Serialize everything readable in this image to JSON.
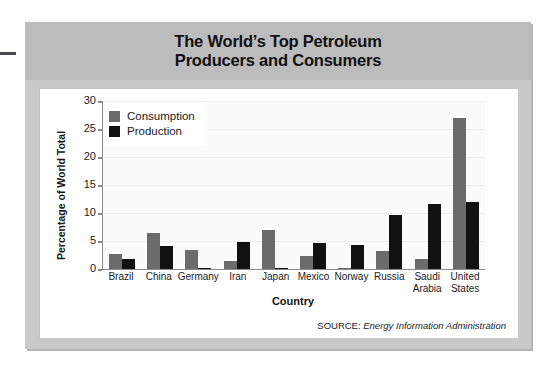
{
  "figure": {
    "title_line1": "The World’s Top Petroleum",
    "title_line2": "Producers and Consumers",
    "source_prefix": "SOURCE:",
    "source_name": "Energy Information Administration"
  },
  "colors": {
    "consumption": "#6b6b6b",
    "production": "#111111",
    "title_band": "#bcbcbc",
    "card": "#c9c9c9",
    "panel": "#ffffff"
  },
  "chart_data": {
    "type": "bar",
    "title": "The World’s Top Petroleum Producers and Consumers",
    "xlabel": "Country",
    "ylabel": "Percentage of World Total",
    "ylim": [
      0,
      30
    ],
    "yticks": [
      0,
      5,
      10,
      15,
      20,
      25,
      30
    ],
    "grid": true,
    "legend_position": "top-left",
    "categories": [
      "Brazil",
      "China",
      "Germany",
      "Iran",
      "Japan",
      "Mexico",
      "Norway",
      "Russia",
      "Saudi Arabia",
      "United States"
    ],
    "category_lines": [
      [
        "Brazil"
      ],
      [
        "China"
      ],
      [
        "Germany"
      ],
      [
        "Iran"
      ],
      [
        "Japan"
      ],
      [
        "Mexico"
      ],
      [
        "Norway"
      ],
      [
        "Russia"
      ],
      [
        "Saudi",
        "Arabia"
      ],
      [
        "United",
        "States"
      ]
    ],
    "series": [
      {
        "name": "Consumption",
        "color": "#6b6b6b",
        "values": [
          2.6,
          6.4,
          3.4,
          1.4,
          7.0,
          2.3,
          0.2,
          3.3,
          1.7,
          27.0
        ]
      },
      {
        "name": "Production",
        "color": "#111111",
        "values": [
          1.7,
          4.1,
          0.1,
          4.9,
          0.1,
          4.6,
          4.3,
          9.7,
          11.6,
          12.0
        ]
      }
    ]
  }
}
